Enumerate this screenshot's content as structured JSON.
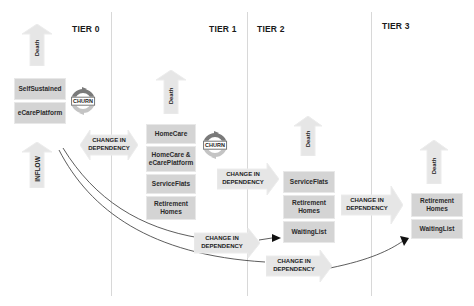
{
  "tiers": [
    "TIER 0",
    "TIER 1",
    "TIER 2",
    "TIER 3"
  ],
  "tier0": {
    "boxes": [
      "SelfSustained",
      "eCarePlatform"
    ],
    "death_label": "Death",
    "inflow_label": "INFLOW",
    "churn_label": "CHURN"
  },
  "tier1": {
    "boxes": [
      "HomeCare",
      "HomeCare &\neCarePlatform",
      "ServiceFlats",
      "Retirement\nHomes"
    ],
    "death_label": "Death",
    "churn_label": "CHURN"
  },
  "tier2": {
    "boxes": [
      "ServiceFlats",
      "Retirement\nHomes",
      "WaitingList"
    ],
    "death_label": "Death"
  },
  "tier3": {
    "boxes": [
      "Retirement\nHomes",
      "WaitingList"
    ],
    "death_label": "Death"
  },
  "transitions": {
    "t0_t1": "CHANGE IN\nDEPENDENCY",
    "t1_t2": "CHANGE IN\nDEPENDENCY",
    "t2_t3": "CHANGE IN\nDEPENDENCY",
    "t0_t2": "CHANGE IN\nDEPENDENCY",
    "t0_t3": "CHANGE IN\nDEPENDENCY"
  },
  "colors": {
    "box_fill": "#d4d4d4",
    "arrow_fill": "#e6e6e6",
    "churn_dark": "#7a7a7a",
    "churn_light": "#c4c4c4",
    "line": "#333333"
  }
}
